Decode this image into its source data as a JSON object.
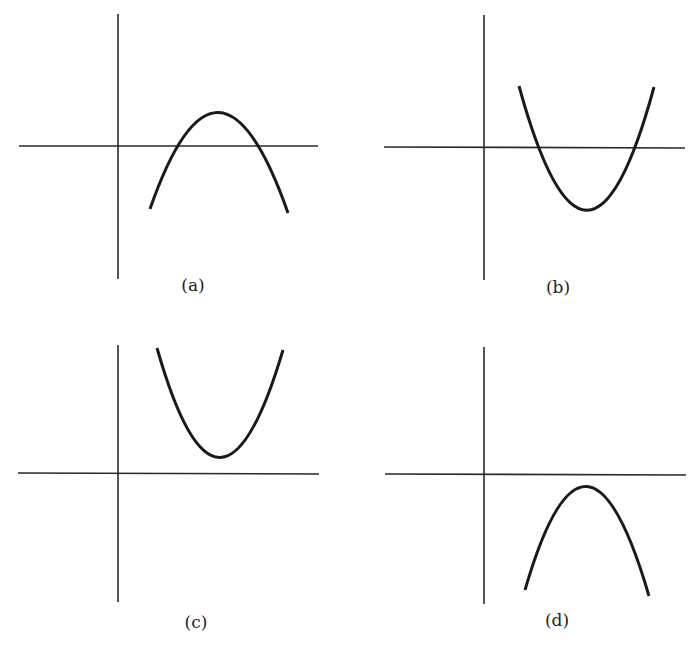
{
  "figure": {
    "panels": [
      {
        "id": "a",
        "label": "(a)",
        "shape": "downward parabola crossing x-axis twice, vertex above x-axis, right of y-axis"
      },
      {
        "id": "b",
        "label": "(b)",
        "shape": "upward parabola crossing x-axis twice, vertex below x-axis, right of y-axis"
      },
      {
        "id": "c",
        "label": "(c)",
        "shape": "upward parabola entirely above x-axis, right of y-axis"
      },
      {
        "id": "d",
        "label": "(d)",
        "shape": "downward parabola entirely below x-axis, right of y-axis"
      }
    ],
    "colors": {
      "background": "#ffffff",
      "ink": "#1a1a1a"
    }
  }
}
